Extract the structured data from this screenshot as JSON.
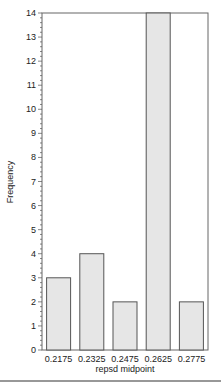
{
  "chart_data": {
    "type": "bar",
    "title": "",
    "xlabel": "repsd midpoint",
    "ylabel": "Frequency",
    "categories": [
      "0.2175",
      "0.2325",
      "0.2475",
      "0.2625",
      "0.2775"
    ],
    "values": [
      3,
      4,
      2,
      14,
      2
    ],
    "ylim": [
      0,
      14
    ],
    "yticks": [
      0,
      1,
      2,
      3,
      4,
      5,
      6,
      7,
      8,
      9,
      10,
      11,
      12,
      13,
      14
    ],
    "minor_ticks_per_unit": 5,
    "grid": false,
    "legend": null,
    "bar_fill": "#e6e6e6",
    "bar_stroke": "#555555"
  }
}
